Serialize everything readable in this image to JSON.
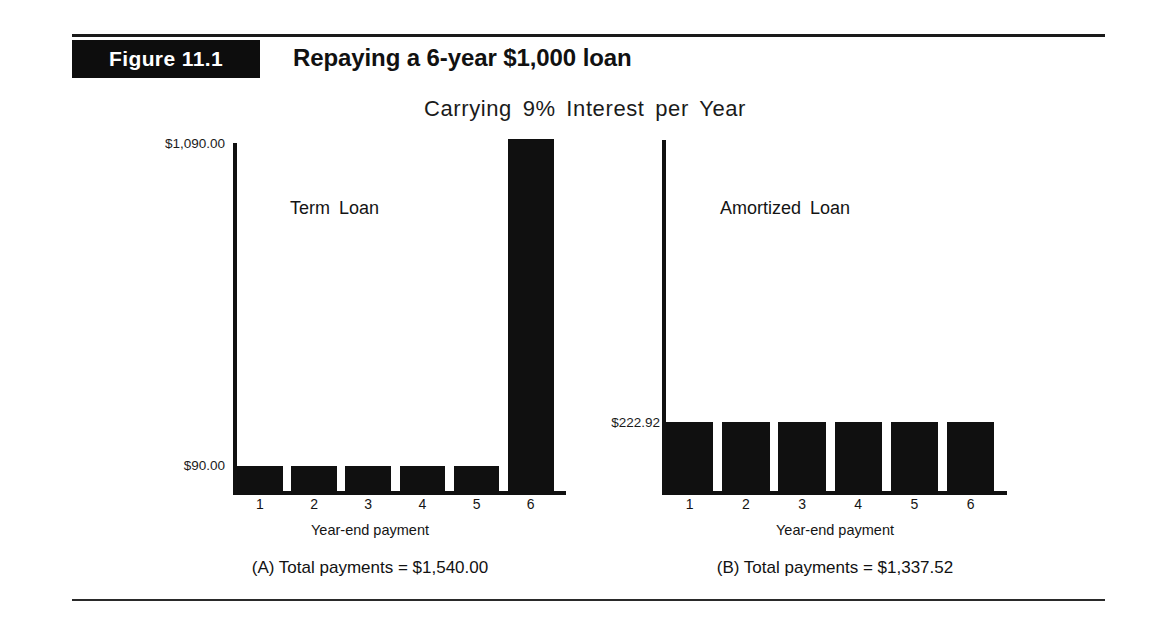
{
  "figure": {
    "badge_label": "Figure 11.1",
    "title": "Repaying a 6-year $1,000 loan",
    "subtitle": "Carrying 9% Interest per Year"
  },
  "panel_a": {
    "plot_title": "Term Loan",
    "xaxis_title": "Year-end payment",
    "ylabel_top": "$1,090.00",
    "ylabel_bottom": "$90.00",
    "footer": "(A) Total payments = $1,540.00",
    "ticks": [
      "1",
      "2",
      "3",
      "4",
      "5",
      "6"
    ]
  },
  "panel_b": {
    "plot_title": "Amortized Loan",
    "xaxis_title": "Year-end payment",
    "ylabel_top": "$222.92",
    "footer": "(B) Total payments = $1,337.52",
    "ticks": [
      "1",
      "2",
      "3",
      "4",
      "5",
      "6"
    ]
  },
  "chart_data": [
    {
      "type": "bar",
      "title": "Term Loan",
      "panel": "(A)",
      "categories": [
        "1",
        "2",
        "3",
        "4",
        "5",
        "6"
      ],
      "values": [
        90.0,
        90.0,
        90.0,
        90.0,
        90.0,
        1090.0
      ],
      "value_labels": [
        "$90.00",
        "$90.00",
        "$90.00",
        "$90.00",
        "$90.00",
        "$1,090.00"
      ],
      "xlabel": "Year-end payment",
      "ylabel": "",
      "ylim": [
        0,
        1090
      ],
      "ytick_labels": [
        "$90.00",
        "$1,090.00"
      ],
      "ytick_values": [
        90.0,
        1090.0
      ],
      "grid": false,
      "legend": false,
      "bar_color": "#101010",
      "total_label": "(A) Total payments = $1,540.00",
      "total_value": 1540.0
    },
    {
      "type": "bar",
      "title": "Amortized Loan",
      "panel": "(B)",
      "categories": [
        "1",
        "2",
        "3",
        "4",
        "5",
        "6"
      ],
      "values": [
        222.92,
        222.92,
        222.92,
        222.92,
        222.92,
        222.92
      ],
      "value_labels": [
        "$222.92",
        "$222.92",
        "$222.92",
        "$222.92",
        "$222.92",
        "$222.92"
      ],
      "xlabel": "Year-end payment",
      "ylabel": "",
      "ylim": [
        0,
        1090
      ],
      "ytick_labels": [
        "$222.92"
      ],
      "ytick_values": [
        222.92
      ],
      "grid": false,
      "legend": false,
      "bar_color": "#101010",
      "total_label": "(B) Total payments = $1,337.52",
      "total_value": 1337.52
    }
  ]
}
